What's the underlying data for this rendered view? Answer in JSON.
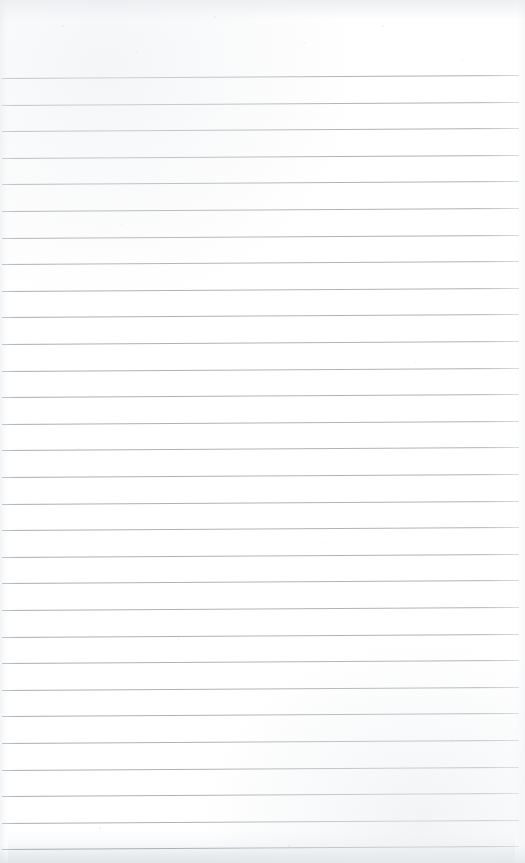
{
  "document": {
    "type": "scanned-lined-notebook-page",
    "title": "Blank Ruled Notebook Page",
    "content_text": "",
    "handwriting_present": "none",
    "page_width": 525,
    "page_height": 863
  },
  "paper": {
    "background_color": "#ffffff",
    "top_margin_height": 70,
    "bottom_edge_color": "#eceef0",
    "left_edge_color": "#f2f3f5",
    "right_edge_color": "#f7f8f9",
    "scan_noise": "faint-speckle"
  },
  "ruling": {
    "line_color": "#a9aeb6",
    "line_thickness_px": 1,
    "line_spacing_px": 26.6,
    "first_line_y": 78,
    "last_line_y": 850,
    "line_count": 30,
    "line_left_x": 2,
    "line_right_x": 519,
    "tilt_degrees": -0.33,
    "lines": [
      {
        "index": 1,
        "y": 78.0,
        "left": 2,
        "width": 517
      },
      {
        "index": 2,
        "y": 104.6,
        "left": 2,
        "width": 517
      },
      {
        "index": 3,
        "y": 131.2,
        "left": 2,
        "width": 517
      },
      {
        "index": 4,
        "y": 157.8,
        "left": 2,
        "width": 517
      },
      {
        "index": 5,
        "y": 184.4,
        "left": 2,
        "width": 517
      },
      {
        "index": 6,
        "y": 211.0,
        "left": 2,
        "width": 517
      },
      {
        "index": 7,
        "y": 237.6,
        "left": 2,
        "width": 517
      },
      {
        "index": 8,
        "y": 264.2,
        "left": 2,
        "width": 517
      },
      {
        "index": 9,
        "y": 290.8,
        "left": 2,
        "width": 517
      },
      {
        "index": 10,
        "y": 317.4,
        "left": 2,
        "width": 517
      },
      {
        "index": 11,
        "y": 344.0,
        "left": 2,
        "width": 517
      },
      {
        "index": 12,
        "y": 370.6,
        "left": 2,
        "width": 517
      },
      {
        "index": 13,
        "y": 397.2,
        "left": 2,
        "width": 517
      },
      {
        "index": 14,
        "y": 423.8,
        "left": 2,
        "width": 517
      },
      {
        "index": 15,
        "y": 450.4,
        "left": 2,
        "width": 517
      },
      {
        "index": 16,
        "y": 477.0,
        "left": 2,
        "width": 517
      },
      {
        "index": 17,
        "y": 503.6,
        "left": 2,
        "width": 517
      },
      {
        "index": 18,
        "y": 530.2,
        "left": 2,
        "width": 517
      },
      {
        "index": 19,
        "y": 556.8,
        "left": 2,
        "width": 517
      },
      {
        "index": 20,
        "y": 583.4,
        "left": 2,
        "width": 517
      },
      {
        "index": 21,
        "y": 610.0,
        "left": 2,
        "width": 517
      },
      {
        "index": 22,
        "y": 636.6,
        "left": 2,
        "width": 517
      },
      {
        "index": 23,
        "y": 663.2,
        "left": 2,
        "width": 517
      },
      {
        "index": 24,
        "y": 689.8,
        "left": 2,
        "width": 517
      },
      {
        "index": 25,
        "y": 716.4,
        "left": 2,
        "width": 517
      },
      {
        "index": 26,
        "y": 743.0,
        "left": 2,
        "width": 517
      },
      {
        "index": 27,
        "y": 769.6,
        "left": 2,
        "width": 517
      },
      {
        "index": 28,
        "y": 796.2,
        "left": 2,
        "width": 517
      },
      {
        "index": 29,
        "y": 822.8,
        "left": 2,
        "width": 517
      },
      {
        "index": 30,
        "y": 849.4,
        "left": 2,
        "width": 517
      }
    ]
  }
}
